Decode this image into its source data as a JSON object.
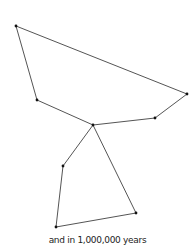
{
  "diagram": {
    "caption": "and in 1,000,000 years",
    "line_color": "#555555",
    "star_color": "#111111",
    "stars": [
      {
        "id": "s1",
        "x": 16,
        "y": 26
      },
      {
        "id": "s2",
        "x": 37,
        "y": 100
      },
      {
        "id": "s3",
        "x": 93,
        "y": 125
      },
      {
        "id": "s4",
        "x": 155,
        "y": 118
      },
      {
        "id": "s5",
        "x": 187,
        "y": 94
      },
      {
        "id": "s6",
        "x": 63,
        "y": 166
      },
      {
        "id": "s7",
        "x": 56,
        "y": 227
      },
      {
        "id": "s8",
        "x": 136,
        "y": 213
      }
    ],
    "edges": [
      [
        "s1",
        "s5"
      ],
      [
        "s1",
        "s2"
      ],
      [
        "s2",
        "s3"
      ],
      [
        "s3",
        "s4"
      ],
      [
        "s4",
        "s5"
      ],
      [
        "s3",
        "s6"
      ],
      [
        "s6",
        "s7"
      ],
      [
        "s7",
        "s8"
      ],
      [
        "s8",
        "s3"
      ]
    ]
  }
}
